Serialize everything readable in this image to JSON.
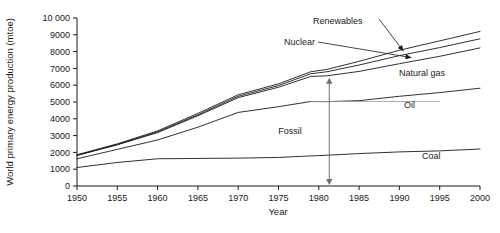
{
  "chart_data": {
    "type": "area",
    "title": "",
    "xlabel": "Year",
    "ylabel": "World primary energy production (mtoe)",
    "xlim": [
      1950,
      2000
    ],
    "ylim": [
      0,
      10000
    ],
    "grid": false,
    "legend_position": "inline-labels",
    "xticks": [
      1950,
      1955,
      1960,
      1965,
      1970,
      1975,
      1980,
      1985,
      1990,
      1995,
      2000
    ],
    "xtick_labels": [
      "1950",
      "1955",
      "1960",
      "1965",
      "1970",
      "1975",
      "1980",
      "1985",
      "1990",
      "1995",
      "2000"
    ],
    "yticks": [
      0,
      1000,
      2000,
      3000,
      4000,
      5000,
      6000,
      7000,
      8000,
      9000,
      10000
    ],
    "ytick_labels": [
      "0",
      "1000",
      "2000",
      "3000",
      "4000",
      "5000",
      "6000",
      "7000",
      "8000",
      "9000",
      "10 000"
    ],
    "x": [
      1950,
      1955,
      1960,
      1965,
      1970,
      1975,
      1979,
      1981,
      1985,
      1990,
      1995,
      2000
    ],
    "series": [
      {
        "name": "Coal",
        "label": "Coal",
        "cumulative": true,
        "values": [
          1100,
          1400,
          1620,
          1640,
          1660,
          1700,
          1790,
          1830,
          1930,
          2030,
          2090,
          2200
        ]
      },
      {
        "name": "Oil",
        "label": "Oil",
        "cumulative": true,
        "values": [
          1620,
          2180,
          2740,
          3500,
          4380,
          4720,
          5030,
          5020,
          5080,
          5340,
          5560,
          5820
        ]
      },
      {
        "name": "Natural gas",
        "label": "Natural gas",
        "cumulative": true,
        "values": [
          1820,
          2450,
          3180,
          4180,
          5260,
          5880,
          6520,
          6560,
          6820,
          7280,
          7720,
          8220
        ]
      },
      {
        "name": "Nuclear",
        "label": "Nuclear",
        "cumulative": true,
        "values": [
          1830,
          2470,
          3220,
          4240,
          5340,
          5980,
          6680,
          6800,
          7200,
          7760,
          8240,
          8760
        ]
      },
      {
        "name": "Renewables",
        "label": "Renewables",
        "cumulative": true,
        "values": [
          1860,
          2510,
          3280,
          4320,
          5430,
          6080,
          6800,
          6940,
          7420,
          8080,
          8640,
          9200
        ]
      }
    ],
    "annotations": [
      {
        "name": "fossil-bracket",
        "text": "Fossil",
        "x": 1981,
        "y_from": 0,
        "y_to": 6560,
        "style": "double-headed-vertical-arrow"
      },
      {
        "name": "renewables-leader",
        "text": "Renewables",
        "points_to_x": 1990,
        "points_to_y": 8080
      },
      {
        "name": "nuclear-leader",
        "text": "Nuclear",
        "points_to_x": 1990,
        "points_to_y": 7760
      }
    ]
  },
  "axes": {
    "y_title": "World primary energy production (mtoe)",
    "x_title": "Year"
  },
  "labels": {
    "renewables": "Renewables",
    "nuclear": "Nuclear",
    "natural_gas": "Natural gas",
    "oil": "Oil",
    "coal": "Coal",
    "fossil": "Fossil"
  },
  "colors": {
    "ink": "#1a1a1a",
    "annotation": "#8a8a8a",
    "background": "#ffffff"
  }
}
